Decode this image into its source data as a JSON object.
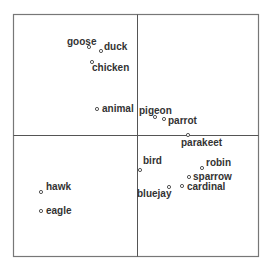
{
  "chart_data": {
    "type": "scatter",
    "title": "",
    "xlabel": "",
    "ylabel": "",
    "grid": false,
    "legend": null,
    "axes": {
      "frame": {
        "left": 13,
        "top": 14,
        "right": 259,
        "bottom": 257
      },
      "center_x": 137,
      "center_y": 135
    },
    "points": [
      {
        "label": "goose",
        "px": 89,
        "py": 47,
        "lx": 67,
        "ly": 45
      },
      {
        "label": "duck",
        "px": 101,
        "py": 51,
        "lx": 104,
        "ly": 50
      },
      {
        "label": "chicken",
        "px": 92,
        "py": 62,
        "lx": 92,
        "ly": 71
      },
      {
        "label": "animal",
        "px": 97,
        "py": 109,
        "lx": 102,
        "ly": 112
      },
      {
        "label": "pigeon",
        "px": 155,
        "py": 117,
        "lx": 139,
        "ly": 114
      },
      {
        "label": "parrot",
        "px": 164,
        "py": 119,
        "lx": 168,
        "ly": 124
      },
      {
        "label": "parakeet",
        "px": 188,
        "py": 135,
        "lx": 181,
        "ly": 146
      },
      {
        "label": "bird",
        "px": 140,
        "py": 170,
        "lx": 143,
        "ly": 164
      },
      {
        "label": "robin",
        "px": 202,
        "py": 168,
        "lx": 206,
        "ly": 166
      },
      {
        "label": "sparrow",
        "px": 189,
        "py": 177,
        "lx": 193,
        "ly": 180
      },
      {
        "label": "cardinal",
        "px": 182,
        "py": 186,
        "lx": 187,
        "ly": 190
      },
      {
        "label": "bluejay",
        "px": 169,
        "py": 187,
        "lx": 137,
        "ly": 197
      },
      {
        "label": "hawk",
        "px": 41,
        "py": 192,
        "lx": 46,
        "ly": 190
      },
      {
        "label": "eagle",
        "px": 41,
        "py": 211,
        "lx": 46,
        "ly": 214
      }
    ]
  }
}
